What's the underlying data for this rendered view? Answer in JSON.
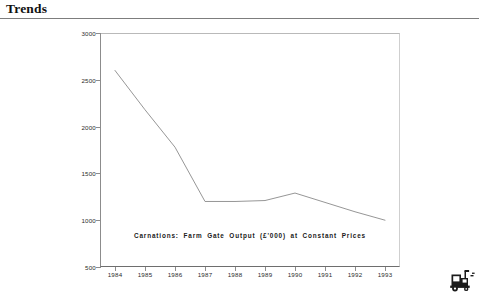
{
  "document": {
    "title": "Trends"
  },
  "chart_data": {
    "type": "line",
    "title": "",
    "caption": "Carnations: Farm Gate Output (£'000) at Constant Prices",
    "xlabel": "",
    "ylabel": "",
    "categories": [
      "1984",
      "1985",
      "1986",
      "1987",
      "1988",
      "1989",
      "1990",
      "1991",
      "1992",
      "1993"
    ],
    "values": [
      2600,
      2180,
      1780,
      1200,
      1200,
      1210,
      1290,
      1190,
      1090,
      1000
    ],
    "series": [
      {
        "name": "Carnations: Farm Gate Output (£'000) at Constant Prices",
        "values": [
          2600,
          2180,
          1780,
          1200,
          1200,
          1210,
          1290,
          1190,
          1090,
          1000
        ]
      }
    ],
    "ylim": [
      500,
      3000
    ],
    "ytick_values": [
      500,
      1000,
      1500,
      2000,
      2500,
      3000
    ],
    "ytick_labels": [
      "500",
      "1000",
      "1500",
      "2000",
      "2500",
      "3000"
    ],
    "xtick_labels": [
      "1984",
      "1985",
      "1986",
      "1987",
      "1988",
      "1989",
      "1990",
      "1991",
      "1992",
      "1993"
    ],
    "grid": false,
    "legend": false,
    "line_color": "#8a8a8a",
    "axis_color": "#6e6e6e"
  },
  "icons": {
    "corner": "tractor-icon"
  }
}
